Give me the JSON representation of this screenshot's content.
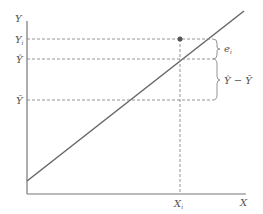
{
  "diagram": {
    "type": "regression-decomposition",
    "axes": {
      "x_label": "X",
      "y_label": "Y"
    },
    "y_ticks": {
      "yi_main": "Y",
      "yi_sub": "i",
      "yhat": "Ŷ",
      "ybar": "Ȳ"
    },
    "x_ticks": {
      "xi_main": "X",
      "xi_sub": "i"
    },
    "braces": {
      "residual_main": "e",
      "residual_sub": "i",
      "explained": "Ŷ − Ȳ"
    },
    "colors": {
      "line": "#666666",
      "dash": "#888888",
      "text": "#555555",
      "point": "#555555"
    }
  }
}
